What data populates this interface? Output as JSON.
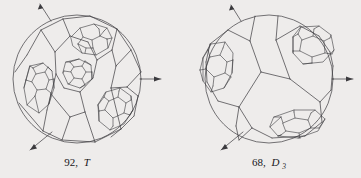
{
  "figure": {
    "background_color": "#eeeceb",
    "stroke_color": "#3b3a3e",
    "panels": [
      {
        "id": "left",
        "name": "polyhedron-diagram-92-T",
        "caption_count": "92,",
        "caption_symmetry": "T",
        "caption_subscript": "",
        "caption_full": "92, T",
        "arrows": 3,
        "circle": {
          "cx": 77,
          "cy": 79,
          "r": 64
        }
      },
      {
        "id": "right",
        "name": "polyhedron-diagram-68-D3",
        "caption_count": "68,",
        "caption_symmetry": "D",
        "caption_subscript": "3",
        "caption_full": "68, D3",
        "arrows": 3,
        "circle": {
          "cx": 269,
          "cy": 79,
          "r": 64
        }
      }
    ]
  }
}
